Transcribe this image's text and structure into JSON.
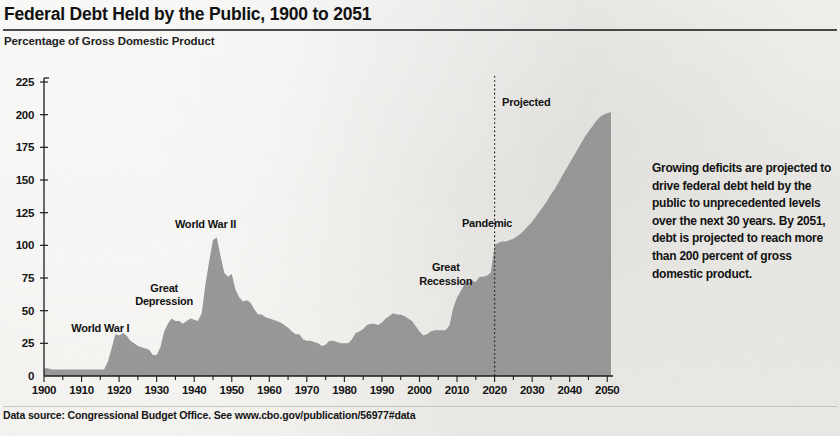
{
  "header": {
    "title": "Federal Debt Held by the Public, 1900 to 2051",
    "subtitle": "Percentage of Gross Domestic Product"
  },
  "side_note": "Growing deficits are projected to drive federal debt held by the public to unprecedented levels over the next 30 years. By 2051, debt is projected to reach more than 200 percent of gross domestic product.",
  "footer": {
    "source": "Data source: Congressional Budget Office. See www.cbo.gov/publication/56977#data"
  },
  "chart_data": {
    "type": "area",
    "title": "Federal Debt Held by the Public, 1900 to 2051",
    "subtitle": "Percentage of Gross Domestic Product",
    "xlabel": "",
    "ylabel": "Percentage of Gross Domestic Product",
    "xlim": [
      1900,
      2051
    ],
    "ylim": [
      0,
      225
    ],
    "ytick_labels": [
      "0",
      "25",
      "50",
      "75",
      "100",
      "125",
      "150",
      "175",
      "200",
      "225"
    ],
    "yticks": [
      0,
      25,
      50,
      75,
      100,
      125,
      150,
      175,
      200,
      225
    ],
    "xtick_labels": [
      "1900",
      "1910",
      "1920",
      "1930",
      "1940",
      "1950",
      "1960",
      "1970",
      "1980",
      "1990",
      "2000",
      "2010",
      "2020",
      "2030",
      "2040",
      "2050"
    ],
    "xticks": [
      1900,
      1910,
      1920,
      1930,
      1940,
      1950,
      1960,
      1970,
      1980,
      1990,
      2000,
      2010,
      2020,
      2030,
      2040,
      2050
    ],
    "grid": false,
    "legend": null,
    "area_color": "#8f8f8f",
    "projection_divider_year": 2020,
    "annotations": [
      {
        "id": "projected",
        "text": "Projected",
        "x_year": 2022,
        "y_value": 214,
        "align": "left"
      },
      {
        "id": "world-war-i",
        "text": "World War I",
        "x_year": 1915,
        "y_value": 41,
        "align": "center"
      },
      {
        "id": "great-depression",
        "text": "Great Depression",
        "x_year": 1932,
        "y_value": 72,
        "align": "center"
      },
      {
        "id": "world-war-ii",
        "text": "World War II",
        "x_year": 1943,
        "y_value": 121,
        "align": "center"
      },
      {
        "id": "great-recession",
        "text": "Great Recession",
        "x_year": 2007,
        "y_value": 88,
        "align": "center"
      },
      {
        "id": "pandemic",
        "text": "Pandemic",
        "x_year": 2018,
        "y_value": 122,
        "align": "center"
      }
    ],
    "x": [
      1900,
      1901,
      1902,
      1903,
      1904,
      1905,
      1906,
      1907,
      1908,
      1909,
      1910,
      1911,
      1912,
      1913,
      1914,
      1915,
      1916,
      1917,
      1918,
      1919,
      1920,
      1921,
      1922,
      1923,
      1924,
      1925,
      1926,
      1927,
      1928,
      1929,
      1930,
      1931,
      1932,
      1933,
      1934,
      1935,
      1936,
      1937,
      1938,
      1939,
      1940,
      1941,
      1942,
      1943,
      1944,
      1945,
      1946,
      1947,
      1948,
      1949,
      1950,
      1951,
      1952,
      1953,
      1954,
      1955,
      1956,
      1957,
      1958,
      1959,
      1960,
      1961,
      1962,
      1963,
      1964,
      1965,
      1966,
      1967,
      1968,
      1969,
      1970,
      1971,
      1972,
      1973,
      1974,
      1975,
      1976,
      1977,
      1978,
      1979,
      1980,
      1981,
      1982,
      1983,
      1984,
      1985,
      1986,
      1987,
      1988,
      1989,
      1990,
      1991,
      1992,
      1993,
      1994,
      1995,
      1996,
      1997,
      1998,
      1999,
      2000,
      2001,
      2002,
      2003,
      2004,
      2005,
      2006,
      2007,
      2008,
      2009,
      2010,
      2011,
      2012,
      2013,
      2014,
      2015,
      2016,
      2017,
      2018,
      2019,
      2020,
      2021,
      2022,
      2023,
      2024,
      2025,
      2026,
      2027,
      2028,
      2029,
      2030,
      2031,
      2032,
      2033,
      2034,
      2035,
      2036,
      2037,
      2038,
      2039,
      2040,
      2041,
      2042,
      2043,
      2044,
      2045,
      2046,
      2047,
      2048,
      2049,
      2050,
      2051
    ],
    "values": [
      6,
      6,
      5,
      5,
      5,
      5,
      5,
      5,
      5,
      5,
      5,
      5,
      5,
      5,
      5,
      5,
      5,
      11,
      21,
      32,
      31,
      33,
      31,
      27,
      25,
      23,
      22,
      21,
      20,
      16,
      16,
      22,
      34,
      40,
      44,
      42,
      42,
      40,
      42,
      44,
      43,
      42,
      48,
      70,
      88,
      104,
      106,
      92,
      79,
      76,
      78,
      66,
      60,
      57,
      58,
      56,
      51,
      47,
      47,
      45,
      44,
      43,
      42,
      41,
      39,
      37,
      34,
      32,
      32,
      28,
      27,
      27,
      26,
      25,
      23,
      24,
      27,
      27,
      26,
      25,
      25,
      25,
      28,
      33,
      34,
      36,
      39,
      40,
      40,
      39,
      41,
      44,
      46,
      48,
      47,
      47,
      46,
      44,
      42,
      38,
      34,
      31,
      32,
      34,
      35,
      35,
      35,
      35,
      39,
      52,
      60,
      65,
      70,
      72,
      73,
      72,
      76,
      76,
      77,
      79,
      100,
      102,
      103,
      103,
      104,
      105,
      107,
      109,
      112,
      115,
      118,
      122,
      126,
      130,
      134,
      139,
      143,
      148,
      153,
      158,
      163,
      168,
      173,
      178,
      183,
      187,
      191,
      195,
      198,
      200,
      201,
      202
    ]
  }
}
